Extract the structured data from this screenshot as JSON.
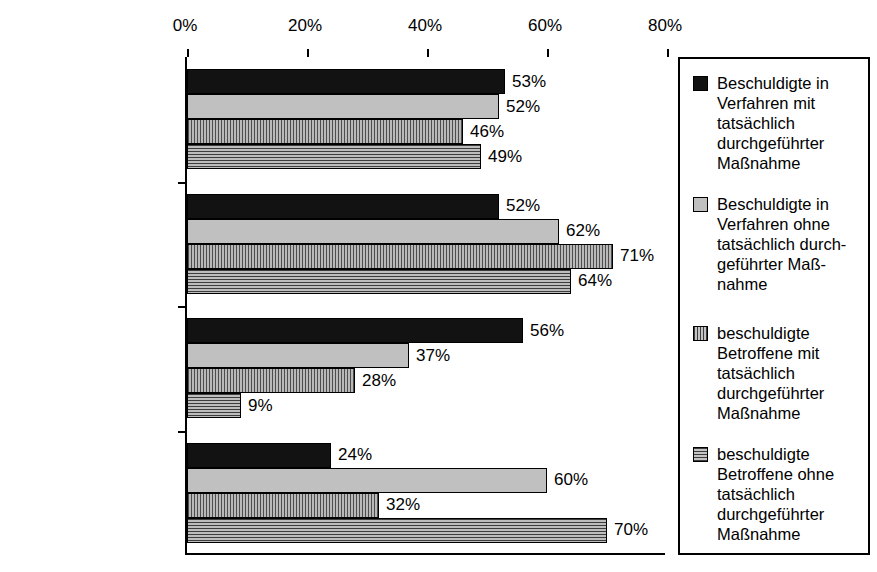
{
  "chart_data": {
    "type": "bar",
    "orientation": "horizontal",
    "title": "",
    "xlabel": "",
    "ylabel": "",
    "xlim": [
      0,
      80
    ],
    "xticks": [
      "0%",
      "20%",
      "40%",
      "60%",
      "80%"
    ],
    "xtick_values": [
      0,
      20,
      40,
      60,
      80
    ],
    "grid": false,
    "legend_position": "right",
    "categories": [
      "Alle",
      "Mord/Totschlag",
      "BtMG (inkl. Komb.)",
      "Sonstige"
    ],
    "series": [
      {
        "name": "Beschuldigte in Verfahren mit tatsächlich durchgeführter Maßnahme",
        "legend_label": "Beschuldigte in\nVerfahren mit\ntatsächlich\ndurchgeführter\nMaßnahme",
        "fill": "black-solid",
        "values": [
          53,
          52,
          56,
          24
        ],
        "labels": [
          "53%",
          "52%",
          "56%",
          "24%"
        ]
      },
      {
        "name": "Beschuldigte in Verfahren ohne tatsächlich durchgeführter Maßnahme",
        "legend_label": "Beschuldigte in\nVerfahren ohne\ntatsächlich durch-\ngeführter Maß-\nnahme",
        "fill": "lightgray-solid",
        "values": [
          52,
          62,
          37,
          60
        ],
        "labels": [
          "52%",
          "62%",
          "37%",
          "60%"
        ]
      },
      {
        "name": "beschuldigte Betroffene mit tatsächlich durchgeführter Maßnahme",
        "legend_label": "beschuldigte\nBetroffene mit\ntatsächlich\ndurchgeführter\nMaßnahme",
        "fill": "gray-vertical-stripes",
        "values": [
          46,
          71,
          28,
          32
        ],
        "labels": [
          "46%",
          "71%",
          "28%",
          "32%"
        ]
      },
      {
        "name": "beschuldigte Betroffene ohne tatsächlich durchgeführter Maßnahme",
        "legend_label": "beschuldigte\nBetroffene ohne\ntatsächlich\ndurchgeführter\nMaßnahme",
        "fill": "gray-horizontal-stripes",
        "values": [
          49,
          64,
          9,
          70
        ],
        "labels": [
          "49%",
          "64%",
          "9%",
          "70%"
        ]
      }
    ]
  },
  "colors": {
    "series_0": "#121212",
    "series_1": "#c0c0c0",
    "series_2": "#808080",
    "series_3": "#808080",
    "axis": "#000000",
    "background": "#ffffff"
  }
}
